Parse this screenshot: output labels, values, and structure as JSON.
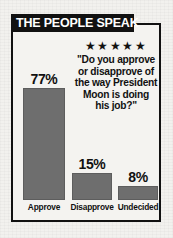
{
  "panel": {
    "title": "THE PEOPLE SPEAK",
    "rating_icon": "star-icon",
    "stars": "★★★★★",
    "star_count": 5
  },
  "question": {
    "lines": [
      "\"Do you approve",
      "or disapprove of",
      "the way President",
      "Moon is doing",
      "his job?\""
    ],
    "full_text": "\"Do you approve or disapprove of the way President Moon is doing his job?\""
  },
  "colors": {
    "bar_fill": "#6e6e6e",
    "bar_stroke": "#5d5d5d",
    "ink": "#111111",
    "paper": "#f2f1ee",
    "panel_bg": "#f4f3f0",
    "title_band_bg": "#111111",
    "title_band_text": "#ffffff"
  },
  "chart_data": {
    "type": "bar",
    "title": "THE PEOPLE SPEAK",
    "subtitle": "\"Do you approve or disapprove of the way President Moon is doing his job?\"",
    "categories": [
      "Approve",
      "Disapprove",
      "Undecided"
    ],
    "values": [
      77,
      15,
      8
    ],
    "value_labels": [
      "77%",
      "15%",
      "8%"
    ],
    "xlabel": "",
    "ylabel": "",
    "ylim": [
      0,
      100
    ],
    "unit": "percent",
    "grid": false,
    "legend": null,
    "orientation": "vertical"
  }
}
